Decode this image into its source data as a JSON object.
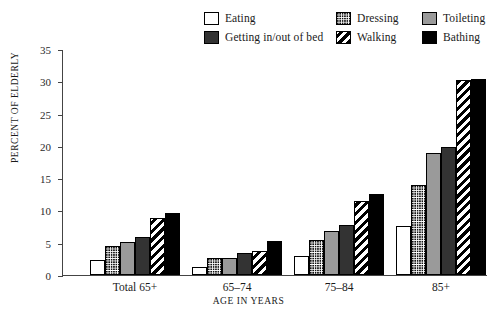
{
  "chart_data": {
    "type": "bar",
    "title": "",
    "xlabel": "AGE IN YEARS",
    "ylabel": "PERCENT OF ELDERLY",
    "ylim": [
      0,
      35
    ],
    "yticks": [
      0,
      5,
      10,
      15,
      20,
      25,
      30,
      35
    ],
    "grid": false,
    "legend_position": "top",
    "categories": [
      "Total 65+",
      "65–74",
      "75–84",
      "85+"
    ],
    "series": [
      {
        "name": "Eating",
        "pattern": "white-outline",
        "color": "#ffffff",
        "values": [
          2.3,
          1.2,
          2.9,
          7.6
        ]
      },
      {
        "name": "Dressing",
        "pattern": "fine-dots",
        "color": "#ffffff",
        "values": [
          4.5,
          2.6,
          5.4,
          14.0
        ]
      },
      {
        "name": "Toileting",
        "pattern": "solid-gray",
        "color": "#9a9a9a",
        "values": [
          5.1,
          2.6,
          6.8,
          18.9
        ]
      },
      {
        "name": "Getting in/out of bed",
        "pattern": "solid-dark-gray",
        "color": "#333333",
        "values": [
          5.9,
          3.4,
          7.7,
          19.9
        ]
      },
      {
        "name": "Walking",
        "pattern": "diagonal-stripes",
        "color": "#000000",
        "values": [
          8.9,
          3.7,
          11.4,
          30.2
        ]
      },
      {
        "name": "Bathing",
        "pattern": "solid-black",
        "color": "#000000",
        "values": [
          9.6,
          5.2,
          12.5,
          30.4
        ]
      }
    ]
  },
  "legend": {
    "rows": [
      [
        {
          "label": "Eating",
          "swatch": "swatch-eating"
        },
        {
          "label": "Dressing",
          "swatch": "swatch-dressing"
        },
        {
          "label": "Toileting",
          "swatch": "swatch-toileting"
        }
      ],
      [
        {
          "label": "Getting in/out of bed",
          "swatch": "swatch-bed"
        },
        {
          "label": "Walking",
          "swatch": "swatch-walking"
        },
        {
          "label": "Bathing",
          "swatch": "swatch-bathing"
        }
      ]
    ]
  },
  "axes": {
    "y_title": "PERCENT OF ELDERLY",
    "x_title": "AGE IN YEARS",
    "y_tick_labels": [
      "0",
      "5",
      "10",
      "15",
      "20",
      "25",
      "30",
      "35"
    ]
  }
}
